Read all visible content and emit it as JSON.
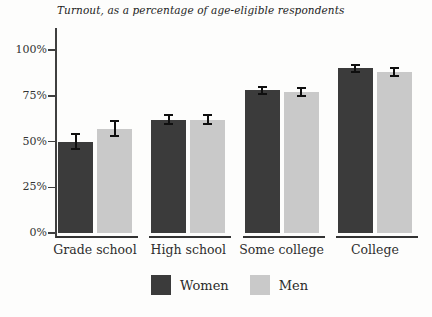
{
  "chart_data": {
    "type": "bar",
    "title": "Turnout, as a percentage of age-eligible respondents",
    "categories": [
      "Grade school",
      "High school",
      "Some college",
      "College"
    ],
    "series": [
      {
        "name": "Women",
        "color": "#3b3b3b",
        "values": [
          50,
          62,
          78,
          90
        ],
        "moe": [
          4,
          2.5,
          2,
          2
        ]
      },
      {
        "name": "Men",
        "color": "#c9c9c9",
        "values": [
          57,
          62,
          77,
          88
        ],
        "moe": [
          4,
          2.5,
          2,
          2
        ]
      }
    ],
    "xlabel": "",
    "ylabel": "",
    "ylim": [
      0,
      100
    ],
    "ytick_values": [
      0,
      25,
      50,
      75,
      100
    ],
    "ytick_labels": [
      "0%",
      "25%",
      "50%",
      "75%",
      "100%"
    ],
    "grid": false,
    "error_bars": true,
    "legend_position": "bottom"
  },
  "colors": {
    "background": "#fdfdfc",
    "axis": "#3f3f3f",
    "text": "#333333",
    "error_bar": "#0f0f0f"
  }
}
